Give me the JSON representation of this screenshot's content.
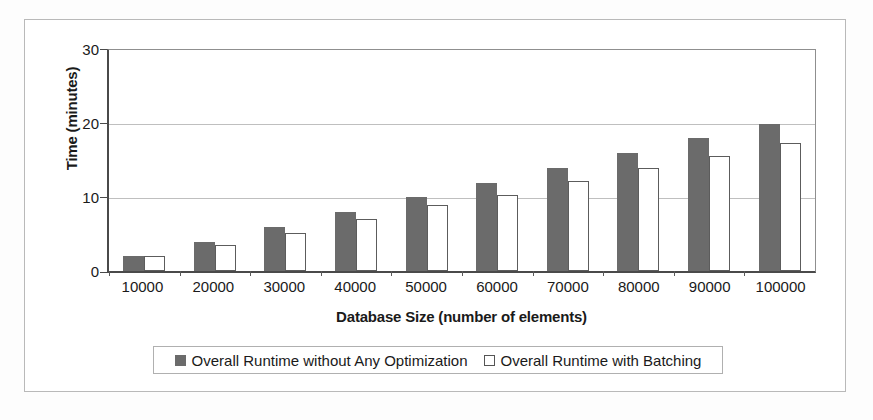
{
  "chart_data": {
    "type": "bar",
    "title": "",
    "xlabel": "Database Size (number of elements)",
    "ylabel": "Time (minutes)",
    "categories": [
      "10000",
      "20000",
      "30000",
      "40000",
      "50000",
      "60000",
      "70000",
      "80000",
      "90000",
      "100000"
    ],
    "series": [
      {
        "name": "Overall Runtime without Any Optimization",
        "color": "#6b6b6b",
        "style": "filled",
        "values": [
          2,
          4,
          6,
          8,
          10,
          12,
          14,
          16,
          18,
          20
        ]
      },
      {
        "name": "Overall Runtime with Batching",
        "color": "#ffffff",
        "style": "outline",
        "values": [
          2,
          3.5,
          5.2,
          7,
          9,
          10.3,
          12.2,
          14,
          15.6,
          17.4
        ]
      }
    ],
    "ylim": [
      0,
      30
    ],
    "yticks": [
      0,
      10,
      20,
      30
    ],
    "ytick_labels": [
      "0",
      "10",
      "20",
      "30"
    ],
    "grid": true,
    "grid_axis": "y",
    "legend_position": "bottom"
  },
  "axes": {
    "y_title": "Time (minutes)",
    "x_title": "Database Size (number of elements)",
    "y_labels": [
      "30",
      "20",
      "10",
      "0"
    ],
    "x_labels": [
      "10000",
      "20000",
      "30000",
      "40000",
      "50000",
      "60000",
      "70000",
      "80000",
      "90000",
      "100000"
    ]
  },
  "legend": {
    "entries": [
      {
        "label": "Overall Runtime without Any Optimization",
        "swatch": "filled-gray-square"
      },
      {
        "label": "Overall Runtime with Batching",
        "swatch": "outline-white-square"
      }
    ]
  },
  "colors": {
    "bar_filled": "#6b6b6b",
    "bar_outline_stroke": "#5c5c5c",
    "gridline": "#bfbfbf",
    "axis": "#4a4a4a",
    "frame": "#b9b9b9"
  }
}
